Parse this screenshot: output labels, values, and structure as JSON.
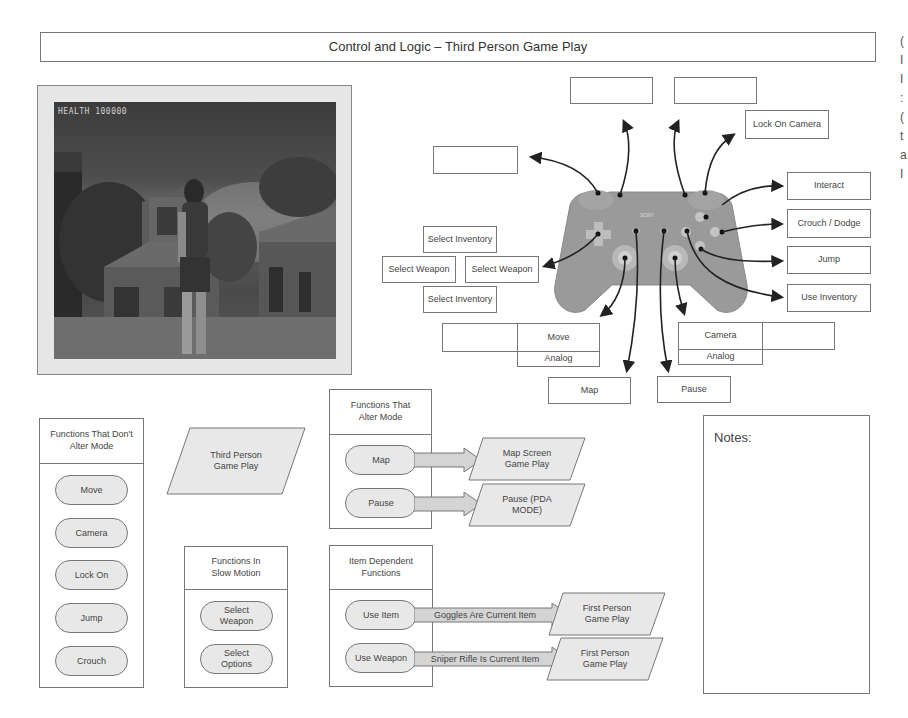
{
  "header": {
    "title": "Control and Logic – Third Person Game Play"
  },
  "screenshot": {
    "hud_text": "HEALTH 100000",
    "description": "third-person game screenshot: character standing before ruined stone buildings"
  },
  "controller": {
    "image": "ps2-dualshock-controller",
    "brand_text": "SONY",
    "labels": {
      "l2": "",
      "l1": "",
      "r2": "",
      "r1": "Lock On Camera",
      "triangle": "Interact",
      "circle": "Crouch / Dodge",
      "cross": "Jump",
      "r3_button": "Use Inventory",
      "dpad_up": "Select Inventory",
      "dpad_left": "Select Weapon",
      "dpad_right": "Select Weapon",
      "dpad_down": "Select Inventory",
      "left_stick": {
        "blank": "",
        "label": "Move",
        "sub": "Analog"
      },
      "right_stick": {
        "label": "Camera",
        "blank": "",
        "sub": "Analog"
      },
      "select": "Map",
      "start": "Pause"
    }
  },
  "panels": {
    "no_mode_change": {
      "title": "Functions That Don't Alter Mode",
      "items": [
        "Move",
        "Camera",
        "Lock On",
        "Jump",
        "Crouch"
      ]
    },
    "state_third_person": "Third Person Game Play",
    "slow_motion": {
      "title": "Functions In Slow Motion",
      "items": [
        "Select Weapon",
        "Select Options"
      ]
    },
    "alter_mode": {
      "title": "Functions That Alter Mode",
      "rows": [
        {
          "function": "Map",
          "condition": "",
          "result": "Map Screen Game Play"
        },
        {
          "function": "Pause",
          "condition": "",
          "result": "Pause (PDA MODE)"
        }
      ]
    },
    "item_dependent": {
      "title": "Item Dependent Functions",
      "rows": [
        {
          "function": "Use Item",
          "condition": "Goggles Are Current Item",
          "result": "First Person Game Play"
        },
        {
          "function": "Use Weapon",
          "condition": "Sniper Rifle Is Current Item",
          "result": "First Person Game Play"
        }
      ]
    }
  },
  "notes": {
    "label": "Notes:",
    "body": ""
  },
  "colors": {
    "border": "#777777",
    "fill_grey": "#e8e8e8",
    "controller_grey": "#9a9a9a",
    "arrow": "#222222"
  }
}
